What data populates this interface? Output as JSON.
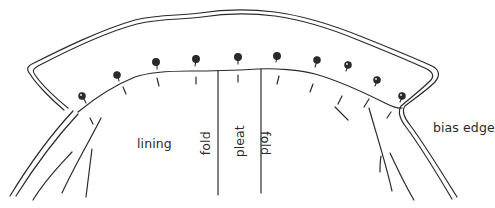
{
  "diagram": {
    "type": "sewing-illustration",
    "labels": {
      "lining": "lining",
      "fold_left": "fold",
      "pleat": "pleat",
      "fold_right": "fold",
      "bias_edge": "bias edge"
    },
    "pin_count": 10,
    "colors": {
      "line": "#2a2a2a",
      "background": "#ffffff"
    }
  }
}
